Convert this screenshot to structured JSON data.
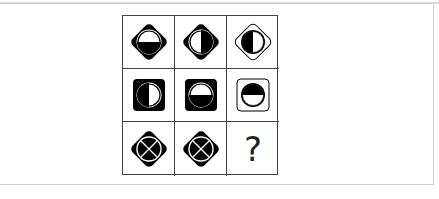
{
  "puzzle": {
    "type": "3x3 matrix reasoning",
    "cells": [
      {
        "row": 1,
        "col": 1,
        "outer": "diamond-filled",
        "inner": "circle",
        "fill": "bottom-half"
      },
      {
        "row": 1,
        "col": 2,
        "outer": "diamond-filled",
        "inner": "circle",
        "fill": "right-half"
      },
      {
        "row": 1,
        "col": 3,
        "outer": "diamond-outline",
        "inner": "circle-filled-band",
        "fill": "left-half"
      },
      {
        "row": 2,
        "col": 1,
        "outer": "square-filled",
        "inner": "circle",
        "fill": "left-half"
      },
      {
        "row": 2,
        "col": 2,
        "outer": "square-filled",
        "inner": "circle",
        "fill": "bottom-half"
      },
      {
        "row": 2,
        "col": 3,
        "outer": "square-outline",
        "inner": "circle-filled-band",
        "fill": "top-half"
      },
      {
        "row": 3,
        "col": 1,
        "outer": "diamond-filled",
        "inner": "circle",
        "fill": "x-cross"
      },
      {
        "row": 3,
        "col": 2,
        "outer": "diamond-filled",
        "inner": "circle",
        "fill": "x-cross"
      },
      {
        "row": 3,
        "col": 3,
        "outer": "none",
        "inner": "none",
        "fill": "unknown"
      }
    ],
    "missing_label": "?"
  },
  "colors": {
    "ink": "#000000",
    "background": "#ffffff",
    "grid_line": "#444444",
    "panel_border": "#cfcfcf"
  }
}
